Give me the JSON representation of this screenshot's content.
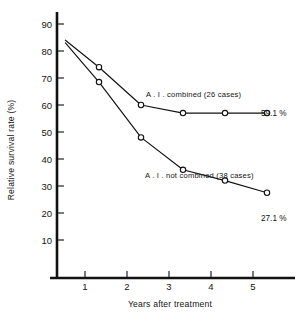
{
  "chart_data": {
    "type": "line",
    "title": "",
    "subtitle": "",
    "xlabel": "Years after treatment",
    "ylabel": "Relative survival rate (%)",
    "xlim": [
      0,
      5.5
    ],
    "ylim": [
      0,
      95
    ],
    "grid": false,
    "legend_position": "inline-annotation",
    "x_ticks": [
      "1",
      "2",
      "3",
      "4",
      "5"
    ],
    "x_tick_values": [
      1,
      2,
      3,
      4,
      5
    ],
    "y_ticks": [
      "10",
      "20",
      "30",
      "40",
      "50",
      "60",
      "70",
      "80",
      "90"
    ],
    "y_tick_values": [
      10,
      20,
      30,
      40,
      50,
      60,
      70,
      80,
      90
    ],
    "marker": "open-circle",
    "series": [
      {
        "name": "A.I. combined (26 cases)",
        "annotation": "A . I . combined (26 cases)",
        "endpoint_label": "59.1 %",
        "x": [
          0.2,
          1,
          2,
          3,
          4,
          5
        ],
        "values": [
          84.0,
          74.0,
          60.0,
          57.0,
          57.0,
          57.0
        ],
        "markers_at_x": [
          1,
          2,
          3,
          4,
          5
        ]
      },
      {
        "name": "A.I. not combined (38 cases)",
        "annotation": "A . I . not combined (38 cases)",
        "endpoint_label": "27.1 %",
        "x": [
          0.2,
          1,
          2,
          3,
          4,
          5
        ],
        "values": [
          83.0,
          68.5,
          48.0,
          36.0,
          32.0,
          27.5
        ],
        "markers_at_x": [
          1,
          2,
          3,
          4,
          5
        ]
      }
    ],
    "colors": {
      "line": "#111111",
      "marker_fill": "#ffffff",
      "axis": "#111111",
      "background": "#ffffff"
    }
  }
}
